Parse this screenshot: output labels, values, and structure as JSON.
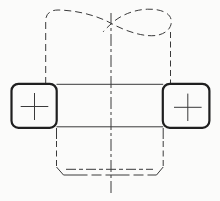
{
  "canvas": {
    "width": 220,
    "height": 201,
    "background": "#fbfbfa",
    "thin_stroke_color": "#3a3a3a",
    "bold_stroke_color": "#1f1f1f",
    "thin_width": 1,
    "bold_width": 2.2
  },
  "drawing": {
    "description": "Orthographic technical drawing: cylinder with conventional loop break (phantom dashed) above a rectangular band with two rounded-square bosses marked by center crosses; hidden chamfered boss below; vertical dash-dot centerline",
    "break_outline": {
      "name": "cylinder-break-outline",
      "path": "M 45.7 84 L 45.7 21 Q 45.7 10.2 58 10 C 76 10.3 96 15 111.5 23.5 C 128 32.5 147 37.8 158.5 35 C 167.5 32.8 172.6 26.5 171 19.2 C 169.6 12.6 160 8.8 147.5 9.2 C 135 9.6 121 14.6 111.5 23.5 C 108 26.8 105.2 29.3 103.2 31.8",
      "dash": "7 4",
      "weight": "thin"
    },
    "lines": [
      {
        "name": "cylinder-right-edge-hidden",
        "x1": 170.5,
        "y1": 32,
        "x2": 170.5,
        "y2": 84,
        "dash": "6 3.5",
        "weight": "thin"
      },
      {
        "name": "vertical-centerline",
        "x1": 111,
        "y1": 13,
        "x2": 111,
        "y2": 193,
        "dash": "12 3 3 3",
        "weight": "thin"
      },
      {
        "name": "band-top-edge",
        "x1": 56.5,
        "y1": 84.3,
        "x2": 163.2,
        "y2": 84.3,
        "dash": "",
        "weight": "thin"
      },
      {
        "name": "band-bottom-edge",
        "x1": 56.5,
        "y1": 126.8,
        "x2": 163.2,
        "y2": 126.8,
        "dash": "",
        "weight": "thin"
      },
      {
        "name": "boss-left-visible-stub",
        "x1": 56.5,
        "y1": 128,
        "x2": 56.5,
        "y2": 139,
        "dash": "",
        "weight": "thin"
      },
      {
        "name": "boss-right-visible-stub",
        "x1": 163.2,
        "y1": 128,
        "x2": 163.2,
        "y2": 139,
        "dash": "",
        "weight": "thin"
      },
      {
        "name": "boss-left-edge-hidden",
        "x1": 56.5,
        "y1": 141,
        "x2": 56.5,
        "y2": 167,
        "dash": "6 3.5",
        "weight": "thin"
      },
      {
        "name": "boss-right-edge-hidden",
        "x1": 163.2,
        "y1": 141,
        "x2": 163.2,
        "y2": 167,
        "dash": "6 3.5",
        "weight": "thin"
      },
      {
        "name": "boss-left-chamfer",
        "x1": 56.5,
        "y1": 167,
        "x2": 63.5,
        "y2": 175,
        "dash": "",
        "weight": "thin"
      },
      {
        "name": "boss-right-chamfer",
        "x1": 163.2,
        "y1": 167,
        "x2": 156.5,
        "y2": 175,
        "dash": "",
        "weight": "thin"
      },
      {
        "name": "boss-bottom-edge-hidden",
        "x1": 63.5,
        "y1": 175,
        "x2": 156.5,
        "y2": 175,
        "dash": "24 4 10 4",
        "weight": "thin"
      },
      {
        "name": "boss-chamfer-root-hidden",
        "x1": 66,
        "y1": 169.3,
        "x2": 153,
        "y2": 169.3,
        "dash": "10 3 4 3",
        "weight": "thin"
      }
    ],
    "squares": [
      {
        "name": "left-boss-square",
        "x": 11.5,
        "y": 83.8,
        "w": 45.2,
        "h": 44,
        "r": 7
      },
      {
        "name": "right-boss-square",
        "x": 162.8,
        "y": 83.8,
        "w": 46.6,
        "h": 44,
        "r": 7
      }
    ],
    "plus_marks": [
      {
        "name": "left-center-cross",
        "cx": 34.5,
        "cy": 106.5,
        "arm_h": 13.8,
        "arm_v": 13.5
      },
      {
        "name": "right-center-cross",
        "cx": 187.8,
        "cy": 107.3,
        "arm_h": 13.8,
        "arm_v": 13.7
      }
    ]
  }
}
